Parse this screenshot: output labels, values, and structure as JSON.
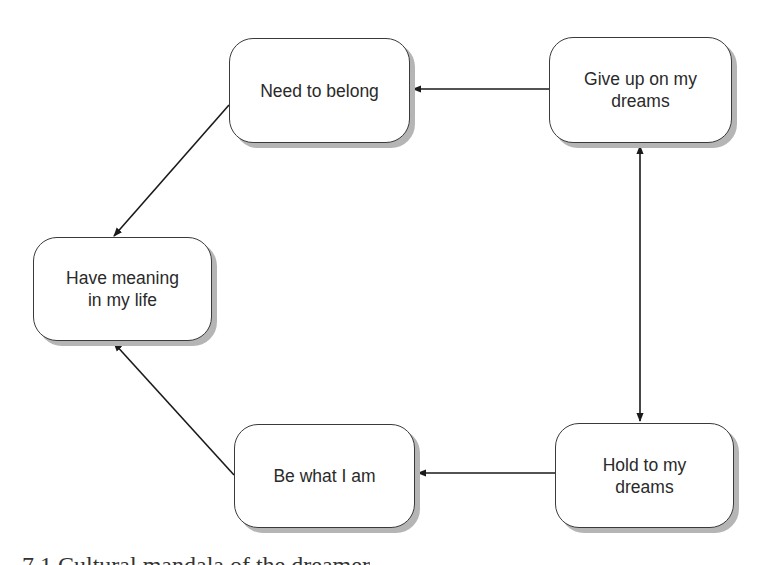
{
  "diagram": {
    "nodes": [
      {
        "id": "need-to-belong",
        "label": "Need  to belong"
      },
      {
        "id": "give-up-dreams",
        "label": "Give up on my\ndreams"
      },
      {
        "id": "have-meaning",
        "label": "Have meaning\nin my life"
      },
      {
        "id": "be-what-i-am",
        "label": "Be what I am"
      },
      {
        "id": "hold-to-dreams",
        "label": "Hold to my\ndreams"
      }
    ],
    "edges": [
      {
        "from": "give-up-dreams",
        "to": "need-to-belong",
        "type": "directed"
      },
      {
        "from": "need-to-belong",
        "to": "have-meaning",
        "type": "directed"
      },
      {
        "from": "be-what-i-am",
        "to": "have-meaning",
        "type": "directed"
      },
      {
        "from": "hold-to-dreams",
        "to": "be-what-i-am",
        "type": "directed"
      },
      {
        "from": "give-up-dreams",
        "to": "hold-to-dreams",
        "type": "bidirectional"
      }
    ],
    "colors": {
      "line": "#1a1a1a",
      "border": "#3a3a3a",
      "shadow": "#b5b5b5",
      "text": "#2a2a2a"
    }
  },
  "caption": {
    "text": "7.1  Cultural  mandala  of  the  dreamer"
  }
}
